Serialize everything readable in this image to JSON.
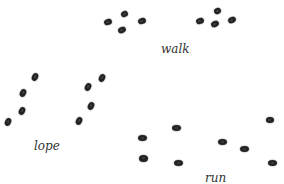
{
  "diagram": {
    "title": "",
    "groups": [
      {
        "id": "walk",
        "label": "walk",
        "label_pos": {
          "x": 161,
          "y": 43
        },
        "prints": [
          {
            "x": 104,
            "y": 19,
            "w": 8,
            "h": 6,
            "rot": -20
          },
          {
            "x": 121,
            "y": 11,
            "w": 7,
            "h": 6,
            "rot": -30
          },
          {
            "x": 138,
            "y": 18,
            "w": 8,
            "h": 6,
            "rot": -20
          },
          {
            "x": 118,
            "y": 27,
            "w": 8,
            "h": 6,
            "rot": -25
          },
          {
            "x": 214,
            "y": 8,
            "w": 7,
            "h": 6,
            "rot": -25
          },
          {
            "x": 196,
            "y": 18,
            "w": 8,
            "h": 6,
            "rot": -20
          },
          {
            "x": 211,
            "y": 21,
            "w": 8,
            "h": 6,
            "rot": -25
          },
          {
            "x": 228,
            "y": 17,
            "w": 8,
            "h": 6,
            "rot": -25
          }
        ]
      },
      {
        "id": "lope",
        "label": "lope",
        "label_pos": {
          "x": 34,
          "y": 140
        },
        "prints": [
          {
            "x": 32,
            "y": 73,
            "w": 6,
            "h": 8,
            "rot": 25
          },
          {
            "x": 20,
            "y": 89,
            "w": 6,
            "h": 8,
            "rot": 25
          },
          {
            "x": 19,
            "y": 107,
            "w": 6,
            "h": 8,
            "rot": 25
          },
          {
            "x": 5,
            "y": 118,
            "w": 6,
            "h": 8,
            "rot": 25
          },
          {
            "x": 99,
            "y": 74,
            "w": 6,
            "h": 8,
            "rot": 25
          },
          {
            "x": 85,
            "y": 83,
            "w": 6,
            "h": 8,
            "rot": 25
          },
          {
            "x": 88,
            "y": 102,
            "w": 6,
            "h": 8,
            "rot": 25
          },
          {
            "x": 76,
            "y": 117,
            "w": 6,
            "h": 8,
            "rot": 25
          }
        ]
      },
      {
        "id": "run",
        "label": "run",
        "label_pos": {
          "x": 205,
          "y": 172
        },
        "prints": [
          {
            "x": 138,
            "y": 135,
            "w": 9,
            "h": 6,
            "rot": 0
          },
          {
            "x": 172,
            "y": 125,
            "w": 9,
            "h": 6,
            "rot": 0
          },
          {
            "x": 139,
            "y": 155,
            "w": 9,
            "h": 7,
            "rot": 0
          },
          {
            "x": 174,
            "y": 160,
            "w": 9,
            "h": 6,
            "rot": 0
          },
          {
            "x": 218,
            "y": 139,
            "w": 9,
            "h": 6,
            "rot": 0
          },
          {
            "x": 240,
            "y": 146,
            "w": 9,
            "h": 6,
            "rot": 0
          },
          {
            "x": 266,
            "y": 117,
            "w": 8,
            "h": 6,
            "rot": 0
          },
          {
            "x": 268,
            "y": 160,
            "w": 9,
            "h": 6,
            "rot": 0
          }
        ]
      }
    ]
  }
}
